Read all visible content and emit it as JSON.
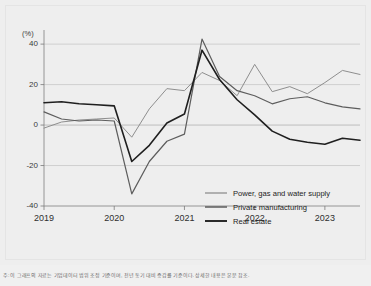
{
  "chart_data": {
    "type": "line",
    "title": "",
    "subtitle": "",
    "xlabel": "",
    "ylabel": "(%)",
    "unit_label": "(%)",
    "ylim": [
      -40,
      45
    ],
    "yticks": [
      40,
      20,
      0,
      -20,
      -40
    ],
    "ytick_labels": [
      "40",
      "20",
      "0",
      "-20",
      "-40"
    ],
    "xticks": [
      "2019",
      "2020",
      "2021",
      "2022",
      "2023"
    ],
    "xtick_positions": [
      0,
      4,
      8,
      12,
      16
    ],
    "x_range": [
      0,
      18
    ],
    "grid": "horizontal-only",
    "legend_position": "inside-lower-right",
    "x": [
      "2019Q1",
      "2019Q2",
      "2019Q3",
      "2019Q4",
      "2020Q1",
      "2020Q2",
      "2020Q3",
      "2020Q4",
      "2021Q1",
      "2021Q2",
      "2021Q3",
      "2021Q4",
      "2022Q1",
      "2022Q2",
      "2022Q3",
      "2022Q4",
      "2023Q1",
      "2023Q2",
      "2023Q3"
    ],
    "series": [
      {
        "name": "Power, gas and water supply",
        "color": "#8e8e8e",
        "values": [
          -1.5,
          1.5,
          2.5,
          3.0,
          3.5,
          -6.0,
          8.0,
          18.0,
          17.0,
          26.0,
          22.0,
          14.5,
          30.0,
          16.5,
          19.0,
          15.5,
          21.0,
          27.0,
          25.0
        ]
      },
      {
        "name": "Private manufacturing",
        "color": "#5d5d5d",
        "values": [
          6.5,
          3.0,
          2.0,
          2.5,
          2.0,
          -34.0,
          -18.0,
          -8.0,
          -4.5,
          42.5,
          24.0,
          17.0,
          14.5,
          10.5,
          13.0,
          14.0,
          11.0,
          9.0,
          8.0
        ]
      },
      {
        "name": "Real estate",
        "color": "#1f1f1f",
        "values": [
          11.0,
          11.5,
          10.5,
          10.0,
          9.5,
          -18.0,
          -10.0,
          1.0,
          5.5,
          37.0,
          22.5,
          12.5,
          5.0,
          -3.0,
          -7.0,
          -8.5,
          -9.5,
          -6.5,
          -7.5
        ]
      }
    ],
    "legend": [
      {
        "label": "Power, gas and water supply",
        "color": "#8e8e8e"
      },
      {
        "label": "Private manufacturing",
        "color": "#5d5d5d"
      },
      {
        "label": "Real estate",
        "color": "#1f1f1f"
      }
    ]
  },
  "footnote": "주: 이 그래프의 자료는 기업데이터 범위 조정 기준이며, 전년 동기 대비 증감률 기준이다. 상세한 내용은 본문 참조."
}
